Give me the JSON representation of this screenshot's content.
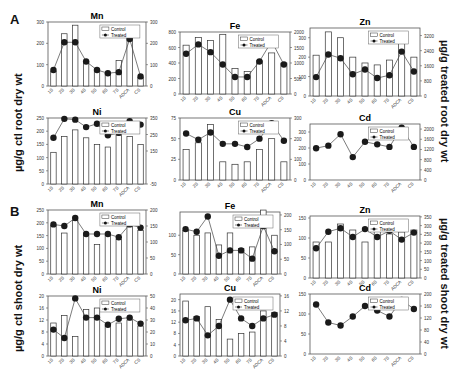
{
  "figure": {
    "panel_a_label": "A",
    "panel_b_label": "B",
    "left_ylabel_a": "µg/g ctl root dry wt",
    "right_ylabel_a": "µg/g treated root dry wt",
    "left_ylabel_b": "µg/g ctl shoot dry wt",
    "right_ylabel_b": "µg/g treated shoot dry wt",
    "legend_control": "Control",
    "legend_treated": "Treated",
    "colors": {
      "bar_fill": "#ffffff",
      "bar_stroke": "#333333",
      "marker": "#1a1a1a",
      "line": "#444444"
    }
  },
  "chart_data": [
    {
      "panel": "A",
      "type": "bar+line",
      "title": "Mn",
      "categories": [
        "1S",
        "2S",
        "3S",
        "4S",
        "5S",
        "6S",
        "7S",
        "ADCA",
        "CS"
      ],
      "series": [
        {
          "name": "Control",
          "axis": "left",
          "values": [
            70,
            245,
            285,
            115,
            80,
            60,
            120,
            250,
            40
          ]
        },
        {
          "name": "Treated",
          "axis": "right",
          "values": [
            75,
            205,
            205,
            115,
            75,
            60,
            65,
            220,
            45
          ]
        }
      ],
      "ylim_left": [
        0,
        300
      ],
      "yticks_left": [
        0,
        100,
        200,
        300
      ],
      "ylim_right": [
        0,
        300
      ],
      "yticks_right": [
        0,
        100,
        200,
        300
      ]
    },
    {
      "panel": "A",
      "type": "bar+line",
      "title": "Fe",
      "categories": [
        "1S",
        "2S",
        "3S",
        "4S",
        "5S",
        "6S",
        "7S",
        "ADCA",
        "CS"
      ],
      "series": [
        {
          "name": "Control",
          "axis": "left",
          "values": [
            630,
            730,
            690,
            770,
            330,
            290,
            430,
            530,
            400
          ]
        },
        {
          "name": "Treated",
          "axis": "right",
          "values": [
            1300,
            1600,
            1350,
            950,
            550,
            550,
            1050,
            1700,
            950
          ]
        }
      ],
      "ylim_left": [
        0,
        800
      ],
      "yticks_left": [
        0,
        200,
        400,
        600,
        800
      ],
      "ylim_right": [
        0,
        2000
      ],
      "yticks_right": [
        0,
        500,
        1000,
        1500,
        2000
      ]
    },
    {
      "panel": "A",
      "type": "bar+line",
      "title": "Zn",
      "categories": [
        "1S",
        "2S",
        "3S",
        "4S",
        "5S",
        "6S",
        "7S",
        "ADCA",
        "CS"
      ],
      "series": [
        {
          "name": "Control",
          "axis": "left",
          "values": [
            210,
            330,
            300,
            200,
            170,
            160,
            185,
            290,
            200
          ]
        },
        {
          "name": "Treated",
          "axis": "right",
          "values": [
            1000,
            2200,
            2000,
            1150,
            1400,
            950,
            1100,
            2350,
            1300
          ]
        }
      ],
      "ylim_left": [
        0,
        350
      ],
      "yticks_left": [
        0,
        100,
        200,
        300
      ],
      "ylim_right": [
        0,
        3600
      ],
      "yticks_right": [
        0,
        800,
        1600,
        2400,
        3200
      ]
    },
    {
      "panel": "A",
      "type": "bar+line",
      "title": "Ni",
      "categories": [
        "1S",
        "2S",
        "3S",
        "4S",
        "5S",
        "6S",
        "7S",
        "ADCA",
        "CS"
      ],
      "series": [
        {
          "name": "Control",
          "axis": "left",
          "values": [
            120,
            180,
            205,
            175,
            150,
            140,
            185,
            180,
            150
          ]
        },
        {
          "name": "Treated",
          "axis": "right",
          "values": [
            230,
            345,
            340,
            295,
            315,
            245,
            260,
            330,
            310
          ]
        }
      ],
      "ylim_left": [
        0,
        250
      ],
      "yticks_left": [
        0,
        50,
        100,
        150,
        200,
        250
      ],
      "ylim_right": [
        -50,
        350
      ],
      "yticks_right": [
        -50,
        150,
        250,
        350
      ]
    },
    {
      "panel": "A",
      "type": "bar+line",
      "title": "Cu",
      "categories": [
        "1S",
        "2S",
        "3S",
        "4S",
        "5S",
        "6S",
        "7S",
        "ADCA",
        "CS"
      ],
      "series": [
        {
          "name": "Control",
          "axis": "left",
          "values": [
            37,
            45,
            67,
            22,
            19,
            22,
            37,
            50,
            22
          ]
        },
        {
          "name": "Treated",
          "axis": "right",
          "values": [
            225,
            195,
            230,
            175,
            175,
            160,
            200,
            275,
            190
          ]
        }
      ],
      "ylim_left": [
        0,
        75
      ],
      "yticks_left": [
        0,
        25,
        50,
        75
      ],
      "ylim_right": [
        0,
        300
      ],
      "yticks_right": [
        0,
        100,
        200,
        300
      ]
    },
    {
      "panel": "A",
      "type": "line",
      "title": "Cd",
      "categories": [
        "1S",
        "2S",
        "3S",
        "4S",
        "5S",
        "6S",
        "7S",
        "ADCA",
        "CS"
      ],
      "series": [
        {
          "name": "Control",
          "axis": "left",
          "values": []
        },
        {
          "name": "Treated",
          "axis": "right",
          "values": [
            1250,
            1350,
            1800,
            900,
            1500,
            1400,
            1300,
            2050,
            1300
          ]
        }
      ],
      "ylim_left": [
        0,
        350
      ],
      "yticks_left": [
        0,
        100,
        200,
        300
      ],
      "ylim_right": [
        0,
        2200
      ],
      "yticks_right": [
        0,
        400,
        800,
        1200,
        1600,
        2000
      ]
    },
    {
      "panel": "B",
      "type": "bar+line",
      "title": "Mn",
      "categories": [
        "1S",
        "2S",
        "3S",
        "4S",
        "5S",
        "6S",
        "7S",
        "ADCA",
        "CS"
      ],
      "series": [
        {
          "name": "Control",
          "axis": "left",
          "values": [
            190,
            160,
            210,
            150,
            115,
            150,
            135,
            185,
            170
          ]
        },
        {
          "name": "Treated",
          "axis": "right",
          "values": [
            155,
            150,
            175,
            125,
            125,
            125,
            115,
            155,
            145
          ]
        }
      ],
      "ylim_left": [
        0,
        250
      ],
      "yticks_left": [
        0,
        50,
        100,
        150,
        200,
        250
      ],
      "ylim_right": [
        0,
        200
      ],
      "yticks_right": [
        0,
        50,
        100,
        150,
        200
      ]
    },
    {
      "panel": "B",
      "type": "bar+line",
      "title": "Fe",
      "categories": [
        "1S",
        "2S",
        "3S",
        "4S",
        "5S",
        "6S",
        "7S",
        "ADCA",
        "CS"
      ],
      "series": [
        {
          "name": "Control",
          "axis": "left",
          "values": [
            112,
            100,
            106,
            75,
            106,
            66,
            70,
            165,
            100
          ]
        },
        {
          "name": "Treated",
          "axis": "right",
          "values": [
            152,
            143,
            195,
            62,
            80,
            80,
            52,
            162,
            77
          ]
        }
      ],
      "ylim_left": [
        0,
        160
      ],
      "yticks_left": [
        0,
        50,
        100
      ],
      "ylim_right": [
        0,
        210
      ],
      "yticks_right": [
        0,
        50,
        100,
        150,
        200
      ]
    },
    {
      "panel": "B",
      "type": "bar+line",
      "title": "Zn",
      "categories": [
        "1S",
        "2S",
        "3S",
        "4S",
        "5S",
        "6S",
        "7S",
        "ADCA",
        "CS"
      ],
      "series": [
        {
          "name": "Control",
          "axis": "left",
          "values": [
            90,
            90,
            135,
            120,
            90,
            120,
            110,
            115,
            120
          ]
        },
        {
          "name": "Treated",
          "axis": "right",
          "values": [
            170,
            265,
            285,
            235,
            280,
            235,
            270,
            220,
            260
          ]
        }
      ],
      "ylim_left": [
        0,
        155
      ],
      "yticks_left": [
        0,
        50,
        100,
        150
      ],
      "ylim_right": [
        0,
        355
      ],
      "yticks_right": [
        0,
        50,
        100,
        150,
        200,
        250,
        300,
        350
      ]
    },
    {
      "panel": "B",
      "type": "bar+line",
      "title": "Ni",
      "categories": [
        "1S",
        "2S",
        "3S",
        "4S",
        "5S",
        "6S",
        "7S",
        "ADCA",
        "CS"
      ],
      "series": [
        {
          "name": "Control",
          "axis": "left",
          "values": [
            11,
            13.5,
            6.5,
            15.5,
            16,
            10,
            11,
            12,
            10
          ]
        },
        {
          "name": "Treated",
          "axis": "right",
          "values": [
            22,
            15,
            48,
            32,
            32,
            26,
            31,
            32,
            27
          ]
        }
      ],
      "ylim_left": [
        0,
        20
      ],
      "yticks_left": [
        0,
        4,
        8,
        12,
        16,
        20
      ],
      "ylim_right": [
        0,
        50
      ],
      "yticks_right": [
        0,
        10,
        20,
        30,
        40,
        50
      ]
    },
    {
      "panel": "B",
      "type": "bar+line",
      "title": "Cu",
      "categories": [
        "1S",
        "2S",
        "3S",
        "4S",
        "5S",
        "6S",
        "7S",
        "ADCA",
        "CS"
      ],
      "series": [
        {
          "name": "Control",
          "axis": "left",
          "values": [
            19.5,
            14,
            17.5,
            13,
            6,
            8,
            8.5,
            16,
            15.5
          ]
        },
        {
          "name": "Treated",
          "axis": "right",
          "values": [
            9.5,
            10,
            5.5,
            8,
            15,
            10,
            8,
            10,
            11
          ]
        }
      ],
      "ylim_left": [
        0,
        22
      ],
      "yticks_left": [
        0,
        4,
        8,
        12,
        16,
        20
      ],
      "ylim_right": [
        0,
        16.5
      ],
      "yticks_right": [
        0,
        4,
        8,
        12,
        16
      ]
    },
    {
      "panel": "B",
      "type": "line",
      "title": "Cd",
      "categories": [
        "1S",
        "2S",
        "3S",
        "4S",
        "5S",
        "6S",
        "7S",
        "ADCA",
        "CS"
      ],
      "series": [
        {
          "name": "Control",
          "axis": "left",
          "values": []
        },
        {
          "name": "Treated",
          "axis": "right",
          "values": [
            165,
            105,
            95,
            125,
            160,
            145,
            125,
            180,
            150
          ]
        }
      ],
      "ylim_left": [
        0,
        150
      ],
      "yticks_left": [
        0,
        50,
        100,
        150
      ],
      "ylim_right": [
        0,
        200
      ],
      "yticks_right": [
        0,
        40,
        80,
        120,
        160,
        200
      ]
    }
  ]
}
